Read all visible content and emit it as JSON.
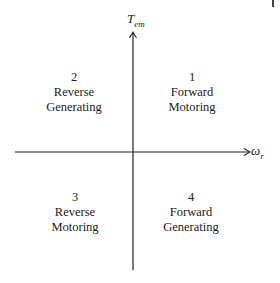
{
  "diagram": {
    "type": "four-quadrant operation diagram",
    "axes": {
      "vertical": {
        "symbol": "T",
        "subscript": "em"
      },
      "horizontal": {
        "symbol": "ω",
        "subscript": "r"
      }
    },
    "quadrants": [
      {
        "number": "1",
        "line1": "Forward",
        "line2": "Motoring"
      },
      {
        "number": "2",
        "line1": "Reverse",
        "line2": "Generating"
      },
      {
        "number": "3",
        "line1": "Reverse",
        "line2": "Motoring"
      },
      {
        "number": "4",
        "line1": "Forward",
        "line2": "Generating"
      }
    ],
    "colors": {
      "line": "#222222",
      "background": "#ffffff"
    }
  }
}
